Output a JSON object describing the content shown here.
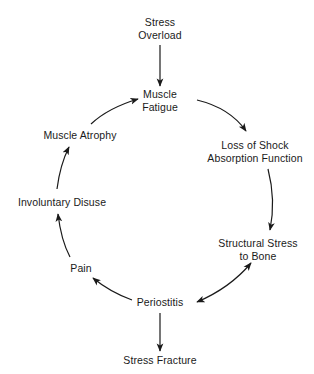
{
  "diagram": {
    "type": "cycle-flowchart",
    "nodes": {
      "stress_overload": {
        "line1": "Stress",
        "line2": "Overload"
      },
      "muscle_fatigue": {
        "line1": "Muscle",
        "line2": "Fatigue"
      },
      "loss_shock": {
        "line1": "Loss of Shock",
        "line2": "Absorption Function"
      },
      "structural_stress": {
        "line1": "Structural Stress",
        "line2": "to Bone"
      },
      "periostitis": {
        "label": "Periostitis"
      },
      "stress_fracture": {
        "label": "Stress Fracture"
      },
      "pain": {
        "label": "Pain"
      },
      "involuntary_disuse": {
        "label": "Involuntary Disuse"
      },
      "muscle_atrophy": {
        "label": "Muscle Atrophy"
      }
    },
    "edges": [
      {
        "from": "Stress Overload",
        "to": "Muscle Fatigue",
        "style": "straight-arrow"
      },
      {
        "from": "Muscle Fatigue",
        "to": "Loss of Shock Absorption Function",
        "style": "curved-arrow"
      },
      {
        "from": "Loss of Shock Absorption Function",
        "to": "Structural Stress to Bone",
        "style": "curved-arrow"
      },
      {
        "from": "Structural Stress to Bone",
        "to": "Periostitis",
        "style": "curved-double-arrow"
      },
      {
        "from": "Periostitis",
        "to": "Stress Fracture",
        "style": "straight-arrow"
      },
      {
        "from": "Periostitis",
        "to": "Pain",
        "style": "curved-arrow"
      },
      {
        "from": "Pain",
        "to": "Involuntary Disuse",
        "style": "curved-arrow"
      },
      {
        "from": "Involuntary Disuse",
        "to": "Muscle Atrophy",
        "style": "curved-arrow"
      },
      {
        "from": "Muscle Atrophy",
        "to": "Muscle Fatigue",
        "style": "curved-arrow"
      }
    ],
    "colors": {
      "stroke": "#1a1a1a",
      "background": "#ffffff"
    }
  }
}
